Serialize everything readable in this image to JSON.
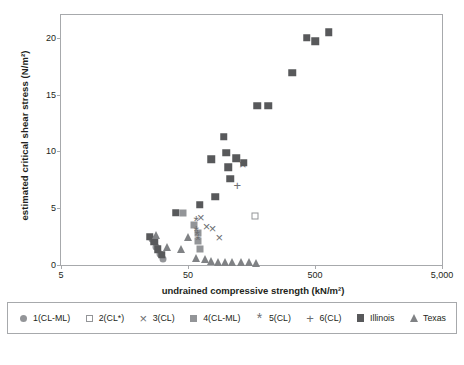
{
  "chart_data": {
    "type": "scatter",
    "title": "",
    "xlabel": "undrained compressive strength (kN/m²)",
    "ylabel": "estimated critical shear stress (N/m²)",
    "xscale": "log",
    "xlim": [
      5,
      5000
    ],
    "ylim": [
      0,
      22
    ],
    "grid": false,
    "legend_position": "bottom",
    "xticks": [
      {
        "value": 5,
        "label": "5"
      },
      {
        "value": 50,
        "label": "50"
      },
      {
        "value": 500,
        "label": "500"
      },
      {
        "value": 5000,
        "label": "5,000"
      }
    ],
    "yticks": [
      {
        "value": 0,
        "label": "0"
      },
      {
        "value": 5,
        "label": "5"
      },
      {
        "value": 10,
        "label": "10"
      },
      {
        "value": 15,
        "label": "15"
      },
      {
        "value": 20,
        "label": "20"
      }
    ],
    "series": [
      {
        "name": "1(CL-ML)",
        "marker": "circle-filled",
        "color": "#939598",
        "points": [
          {
            "x": 26,
            "y": 2.3
          },
          {
            "x": 28,
            "y": 1.6
          },
          {
            "x": 30,
            "y": 1.0
          },
          {
            "x": 32,
            "y": 0.5
          }
        ]
      },
      {
        "name": "2(CL*)",
        "marker": "square-open",
        "color": "#939598",
        "points": [
          {
            "x": 170,
            "y": 4.3
          }
        ]
      },
      {
        "name": "3(CL)",
        "marker": "x",
        "color": "#6d6e71",
        "points": [
          {
            "x": 63,
            "y": 4.2
          },
          {
            "x": 70,
            "y": 3.4
          },
          {
            "x": 78,
            "y": 3.3
          },
          {
            "x": 88,
            "y": 2.5
          },
          {
            "x": 135,
            "y": 8.9
          }
        ]
      },
      {
        "name": "4(CL-ML)",
        "marker": "square-filled-gray",
        "color": "#939598",
        "points": [
          {
            "x": 46,
            "y": 4.6
          },
          {
            "x": 56,
            "y": 3.5
          },
          {
            "x": 60,
            "y": 2.8
          },
          {
            "x": 60,
            "y": 2.1
          },
          {
            "x": 62,
            "y": 1.4
          }
        ]
      },
      {
        "name": "5(CL)",
        "marker": "star",
        "color": "#6d6e71",
        "points": [
          {
            "x": 58,
            "y": 3.9
          },
          {
            "x": 58,
            "y": 3.0
          },
          {
            "x": 59,
            "y": 2.6
          },
          {
            "x": 60,
            "y": 2.2
          }
        ]
      },
      {
        "name": "6(CL)",
        "marker": "plus",
        "color": "#6d6e71",
        "points": [
          {
            "x": 122,
            "y": 7.0
          }
        ]
      },
      {
        "name": "Illinois",
        "marker": "square-filled-dark",
        "color": "#58595b",
        "points": [
          {
            "x": 25,
            "y": 2.5
          },
          {
            "x": 27,
            "y": 2.1
          },
          {
            "x": 29,
            "y": 1.4
          },
          {
            "x": 31,
            "y": 0.9
          },
          {
            "x": 40,
            "y": 4.6
          },
          {
            "x": 62,
            "y": 5.3
          },
          {
            "x": 76,
            "y": 9.3
          },
          {
            "x": 82,
            "y": 6.0
          },
          {
            "x": 96,
            "y": 11.3
          },
          {
            "x": 100,
            "y": 9.9
          },
          {
            "x": 104,
            "y": 8.6
          },
          {
            "x": 108,
            "y": 7.6
          },
          {
            "x": 120,
            "y": 9.4
          },
          {
            "x": 138,
            "y": 9.0
          },
          {
            "x": 176,
            "y": 14.0
          },
          {
            "x": 215,
            "y": 14.0
          },
          {
            "x": 330,
            "y": 16.9
          },
          {
            "x": 430,
            "y": 20.0
          },
          {
            "x": 500,
            "y": 19.7
          },
          {
            "x": 640,
            "y": 20.5
          }
        ]
      },
      {
        "name": "Texas",
        "marker": "triangle-filled",
        "color": "#808285",
        "points": [
          {
            "x": 28,
            "y": 2.6
          },
          {
            "x": 34,
            "y": 1.6
          },
          {
            "x": 44,
            "y": 1.4
          },
          {
            "x": 50,
            "y": 2.5
          },
          {
            "x": 58,
            "y": 0.6
          },
          {
            "x": 68,
            "y": 0.5
          },
          {
            "x": 76,
            "y": 0.35
          },
          {
            "x": 86,
            "y": 0.3
          },
          {
            "x": 98,
            "y": 0.3
          },
          {
            "x": 112,
            "y": 0.3
          },
          {
            "x": 130,
            "y": 0.25
          },
          {
            "x": 152,
            "y": 0.25
          },
          {
            "x": 172,
            "y": 0.2
          }
        ]
      }
    ]
  },
  "legend": {
    "items": [
      {
        "label": "1(CL-ML)",
        "marker": "circle-filled"
      },
      {
        "label": "2(CL*)",
        "marker": "square-open"
      },
      {
        "label": "3(CL)",
        "marker": "x"
      },
      {
        "label": "4(CL-ML)",
        "marker": "square-filled-gray"
      },
      {
        "label": "5(CL)",
        "marker": "star"
      },
      {
        "label": "6(CL)",
        "marker": "plus"
      },
      {
        "label": "Illinois",
        "marker": "square-filled-dark"
      },
      {
        "label": "Texas",
        "marker": "triangle-filled"
      }
    ]
  }
}
